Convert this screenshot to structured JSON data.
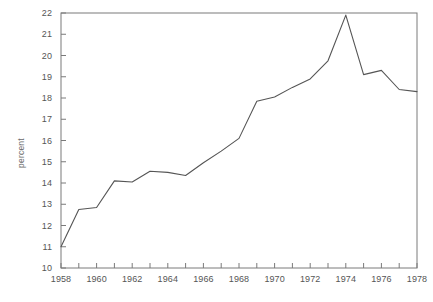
{
  "chart_data": {
    "type": "line",
    "title": "",
    "subtitle": "",
    "xlabel": "",
    "ylabel": "percent",
    "xlim": [
      1958,
      1978
    ],
    "ylim": [
      10,
      22
    ],
    "grid": false,
    "legend": null,
    "legend_position": "none",
    "x_tick_interval": 1,
    "x_label_interval": 2,
    "y_tick_interval": 1,
    "line_color": "#555555",
    "frame_color": "#7a7a7a",
    "x": [
      1958,
      1959,
      1960,
      1961,
      1962,
      1963,
      1964,
      1965,
      1966,
      1967,
      1968,
      1969,
      1970,
      1971,
      1972,
      1973,
      1974,
      1975,
      1976,
      1977,
      1978
    ],
    "values": [
      11.0,
      12.75,
      12.85,
      14.1,
      14.05,
      14.55,
      14.5,
      14.35,
      14.95,
      15.5,
      16.1,
      17.85,
      18.05,
      18.5,
      18.9,
      19.75,
      21.9,
      19.1,
      19.3,
      18.4,
      18.3
    ],
    "series": [
      {
        "name": "percent",
        "values": [
          11.0,
          12.75,
          12.85,
          14.1,
          14.05,
          14.55,
          14.5,
          14.35,
          14.95,
          15.5,
          16.1,
          17.85,
          18.05,
          18.5,
          18.9,
          19.75,
          21.9,
          19.1,
          19.3,
          18.4,
          18.3
        ]
      }
    ],
    "y_tick_labels": [
      "10",
      "11",
      "12",
      "13",
      "14",
      "15",
      "16",
      "17",
      "18",
      "19",
      "20",
      "21",
      "22"
    ],
    "x_tick_labels": [
      "1958",
      "1960",
      "1962",
      "1964",
      "1966",
      "1968",
      "1970",
      "1972",
      "1974",
      "1976",
      "1978"
    ],
    "annotations": []
  },
  "axes": {
    "y_label": "percent"
  },
  "caption": {
    "text": ""
  }
}
